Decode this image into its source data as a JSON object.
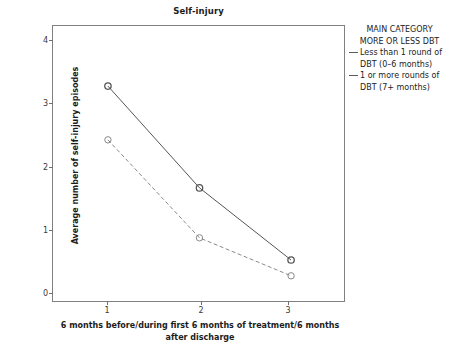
{
  "chart_data": {
    "type": "line",
    "title": "Self-injury",
    "xlabel": "6 months before/during first 6 months of treatment/6 months after discharge",
    "xlabel_line1": "6 months before/during first 6 months of treatment/6 months",
    "xlabel_line2": "after discharge",
    "ylabel": "Average number of self-injury episodes",
    "x": [
      1,
      2,
      3
    ],
    "xticklabels": [
      "1",
      "2",
      "3"
    ],
    "yticklabels": [
      "0",
      "1",
      "2",
      "3",
      "4"
    ],
    "yticks": [
      0,
      1,
      2,
      3,
      4
    ],
    "xlim": [
      0.4,
      3.6
    ],
    "ylim": [
      -0.38,
      4.0
    ],
    "grid": false,
    "legend_position": "right-outside",
    "series": [
      {
        "name": "1 or more rounds of DBT (7+ months)",
        "values": [
          3.05,
          1.44,
          0.3
        ],
        "linestyle": "solid",
        "marker": "open-circle",
        "color": "#555555"
      },
      {
        "name": "Less than 1 round of DBT (0–6 months)",
        "values": [
          2.2,
          0.65,
          0.05
        ],
        "linestyle": "dashed",
        "marker": "open-circle",
        "color": "#8a8a8a"
      }
    ]
  },
  "legend": {
    "title_line1": "MAIN CATEGORY",
    "title_line2": "MORE OR LESS DBT",
    "entries": [
      {
        "label_line1": "Less than 1 round of",
        "label_line2": "DBT (0–6 months)",
        "style": "solid"
      },
      {
        "label_line1": "1 or more rounds of",
        "label_line2": "DBT (7+ months)",
        "style": "solid"
      }
    ]
  },
  "colors": {
    "axis": "#808080",
    "tick_text": "#3a3a3a",
    "series_solid": "#555555",
    "series_dashed": "#8a8a8a",
    "background": "#ffffff"
  }
}
